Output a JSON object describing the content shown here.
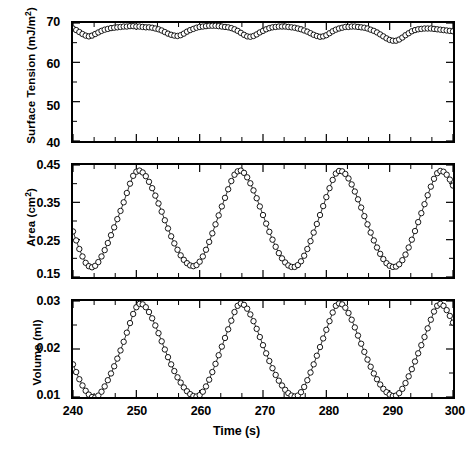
{
  "figure": {
    "panel_count": 3,
    "marker": "open-circle",
    "line_color": "#000000",
    "background": "#ffffff"
  },
  "xaxis": {
    "label": "Time (s)",
    "ticks": [
      "240",
      "250",
      "260",
      "270",
      "280",
      "290",
      "300"
    ],
    "min": 240,
    "max": 300,
    "minor_per_major": 2
  },
  "panels": [
    {
      "key": "surface_tension",
      "ylabel_main": "Surface Tension (mJ/m",
      "ylabel_sup": "2",
      "ylabel_tail": ")",
      "ylabel_plain": "Surface Tension (mJ/m2)",
      "yticks": [
        "70",
        "60",
        "50",
        "40"
      ],
      "ymin": 40,
      "ymax": 70
    },
    {
      "key": "area",
      "ylabel_main": "Area (cm",
      "ylabel_sup": "2",
      "ylabel_tail": ")",
      "ylabel_plain": "Area (cm2)",
      "yticks": [
        "0.45",
        "0.35",
        "0.25",
        "0.15"
      ],
      "ymin": 0.15,
      "ymax": 0.45
    },
    {
      "key": "volume",
      "ylabel_main": "Volume (ml)",
      "ylabel_sup": "",
      "ylabel_tail": "",
      "ylabel_plain": "Volume (ml)",
      "yticks": [
        "0.03",
        "0.02",
        "0.01"
      ],
      "ymin": 0.01,
      "ymax": 0.03
    }
  ],
  "chart_data": [
    {
      "type": "line",
      "title": "",
      "xlabel": "Time (s)",
      "ylabel": "Surface Tension (mJ/m2)",
      "xlim": [
        240,
        300
      ],
      "ylim": [
        40,
        70
      ],
      "grid": false,
      "legend": "none",
      "marker": "open-circle",
      "xticks": [
        240,
        250,
        260,
        270,
        280,
        290,
        300
      ],
      "yticks": [
        40,
        50,
        60,
        70
      ],
      "series": [
        {
          "name": "Surface Tension",
          "x": [
            240.0,
            240.5,
            241.0,
            241.5,
            242.0,
            242.5,
            243.0,
            243.5,
            244.0,
            244.5,
            245.0,
            245.5,
            246.0,
            246.5,
            247.0,
            247.5,
            248.0,
            248.5,
            249.0,
            249.5,
            250.0,
            250.5,
            251.0,
            251.5,
            252.0,
            252.5,
            253.0,
            253.5,
            254.0,
            254.5,
            255.0,
            255.5,
            256.0,
            256.5,
            257.0,
            257.5,
            258.0,
            258.5,
            259.0,
            259.5,
            260.0,
            260.5,
            261.0,
            261.5,
            262.0,
            262.5,
            263.0,
            263.5,
            264.0,
            264.5,
            265.0,
            265.5,
            266.0,
            266.5,
            267.0,
            267.5,
            268.0,
            268.5,
            269.0,
            269.5,
            270.0,
            270.5,
            271.0,
            271.5,
            272.0,
            272.5,
            273.0,
            273.5,
            274.0,
            274.5,
            275.0,
            275.5,
            276.0,
            276.5,
            277.0,
            277.5,
            278.0,
            278.5,
            279.0,
            279.5,
            280.0,
            280.5,
            281.0,
            281.5,
            282.0,
            282.5,
            283.0,
            283.5,
            284.0,
            284.5,
            285.0,
            285.5,
            286.0,
            286.5,
            287.0,
            287.5,
            288.0,
            288.5,
            289.0,
            289.5,
            290.0,
            290.5,
            291.0,
            291.5,
            292.0,
            292.5,
            293.0,
            293.5,
            294.0,
            294.5,
            295.0,
            295.5,
            296.0,
            296.5,
            297.0,
            297.5,
            298.0,
            298.5,
            299.0,
            299.5,
            300.0
          ],
          "y": [
            68.6,
            68.2,
            67.7,
            67.2,
            66.8,
            66.6,
            66.8,
            67.2,
            67.6,
            68.0,
            68.3,
            68.5,
            68.7,
            68.8,
            68.9,
            69.0,
            69.1,
            69.1,
            69.2,
            69.2,
            69.1,
            69.1,
            69.0,
            68.9,
            68.9,
            68.8,
            68.6,
            68.4,
            68.1,
            67.7,
            67.3,
            67.0,
            66.8,
            66.7,
            66.9,
            67.3,
            67.8,
            68.2,
            68.5,
            68.8,
            69.0,
            69.1,
            69.2,
            69.3,
            69.3,
            69.3,
            69.2,
            69.1,
            69.0,
            68.9,
            68.7,
            68.4,
            68.0,
            67.5,
            67.0,
            66.6,
            66.5,
            66.7,
            67.1,
            67.6,
            68.0,
            68.4,
            68.7,
            68.9,
            69.0,
            69.1,
            69.1,
            69.1,
            69.0,
            68.9,
            68.8,
            68.6,
            68.4,
            68.1,
            67.8,
            67.4,
            67.0,
            66.7,
            66.5,
            66.6,
            66.9,
            67.4,
            67.9,
            68.3,
            68.6,
            68.8,
            69.0,
            69.0,
            69.1,
            69.1,
            69.0,
            68.9,
            68.8,
            68.6,
            68.3,
            68.0,
            67.6,
            67.1,
            66.6,
            66.1,
            65.7,
            65.5,
            65.5,
            65.8,
            66.3,
            66.9,
            67.4,
            67.9,
            68.2,
            68.4,
            68.5,
            68.6,
            68.6,
            68.6,
            68.5,
            68.4,
            68.3,
            68.2,
            68.1,
            68.0,
            67.9
          ]
        }
      ]
    },
    {
      "type": "line",
      "title": "",
      "xlabel": "Time (s)",
      "ylabel": "Area (cm2)",
      "xlim": [
        240,
        300
      ],
      "ylim": [
        0.15,
        0.45
      ],
      "grid": false,
      "legend": "none",
      "marker": "open-circle",
      "xticks": [
        240,
        250,
        260,
        270,
        280,
        290,
        300
      ],
      "yticks": [
        0.15,
        0.25,
        0.35,
        0.45
      ],
      "series": [
        {
          "name": "Area",
          "x": [
            240.0,
            240.5,
            241.0,
            241.5,
            242.0,
            242.5,
            243.0,
            243.5,
            244.0,
            244.5,
            245.0,
            245.5,
            246.0,
            246.5,
            247.0,
            247.5,
            248.0,
            248.5,
            249.0,
            249.5,
            250.0,
            250.5,
            251.0,
            251.5,
            252.0,
            252.5,
            253.0,
            253.5,
            254.0,
            254.5,
            255.0,
            255.5,
            256.0,
            256.5,
            257.0,
            257.5,
            258.0,
            258.5,
            259.0,
            259.5,
            260.0,
            260.5,
            261.0,
            261.5,
            262.0,
            262.5,
            263.0,
            263.5,
            264.0,
            264.5,
            265.0,
            265.5,
            266.0,
            266.5,
            267.0,
            267.5,
            268.0,
            268.5,
            269.0,
            269.5,
            270.0,
            270.5,
            271.0,
            271.5,
            272.0,
            272.5,
            273.0,
            273.5,
            274.0,
            274.5,
            275.0,
            275.5,
            276.0,
            276.5,
            277.0,
            277.5,
            278.0,
            278.5,
            279.0,
            279.5,
            280.0,
            280.5,
            281.0,
            281.5,
            282.0,
            282.5,
            283.0,
            283.5,
            284.0,
            284.5,
            285.0,
            285.5,
            286.0,
            286.5,
            287.0,
            287.5,
            288.0,
            288.5,
            289.0,
            289.5,
            290.0,
            290.5,
            291.0,
            291.5,
            292.0,
            292.5,
            293.0,
            293.5,
            294.0,
            294.5,
            295.0,
            295.5,
            296.0,
            296.5,
            297.0,
            297.5,
            298.0,
            298.5,
            299.0,
            299.5,
            300.0
          ],
          "y": [
            0.272,
            0.248,
            0.225,
            0.205,
            0.188,
            0.179,
            0.176,
            0.18,
            0.19,
            0.205,
            0.222,
            0.241,
            0.262,
            0.283,
            0.305,
            0.327,
            0.35,
            0.375,
            0.4,
            0.421,
            0.432,
            0.435,
            0.43,
            0.42,
            0.405,
            0.388,
            0.368,
            0.347,
            0.325,
            0.302,
            0.28,
            0.259,
            0.24,
            0.223,
            0.208,
            0.196,
            0.187,
            0.181,
            0.179,
            0.182,
            0.191,
            0.205,
            0.223,
            0.244,
            0.267,
            0.291,
            0.315,
            0.339,
            0.362,
            0.385,
            0.407,
            0.424,
            0.433,
            0.435,
            0.429,
            0.417,
            0.401,
            0.382,
            0.361,
            0.339,
            0.316,
            0.293,
            0.271,
            0.25,
            0.231,
            0.214,
            0.2,
            0.189,
            0.181,
            0.177,
            0.177,
            0.182,
            0.192,
            0.207,
            0.225,
            0.246,
            0.269,
            0.292,
            0.316,
            0.34,
            0.364,
            0.388,
            0.41,
            0.427,
            0.434,
            0.433,
            0.426,
            0.414,
            0.398,
            0.379,
            0.358,
            0.336,
            0.313,
            0.291,
            0.269,
            0.248,
            0.229,
            0.212,
            0.198,
            0.187,
            0.18,
            0.177,
            0.178,
            0.184,
            0.195,
            0.21,
            0.229,
            0.25,
            0.273,
            0.297,
            0.321,
            0.345,
            0.369,
            0.392,
            0.413,
            0.428,
            0.434,
            0.432,
            0.424,
            0.411,
            0.395
          ]
        }
      ]
    },
    {
      "type": "line",
      "title": "",
      "xlabel": "Time (s)",
      "ylabel": "Volume (ml)",
      "xlim": [
        240,
        300
      ],
      "ylim": [
        0.01,
        0.03
      ],
      "grid": false,
      "legend": "none",
      "marker": "open-circle",
      "xticks": [
        240,
        250,
        260,
        270,
        280,
        290,
        300
      ],
      "yticks": [
        0.01,
        0.02,
        0.03
      ],
      "series": [
        {
          "name": "Volume",
          "x": [
            240.0,
            240.5,
            241.0,
            241.5,
            242.0,
            242.5,
            243.0,
            243.5,
            244.0,
            244.5,
            245.0,
            245.5,
            246.0,
            246.5,
            247.0,
            247.5,
            248.0,
            248.5,
            249.0,
            249.5,
            250.0,
            250.5,
            251.0,
            251.5,
            252.0,
            252.5,
            253.0,
            253.5,
            254.0,
            254.5,
            255.0,
            255.5,
            256.0,
            256.5,
            257.0,
            257.5,
            258.0,
            258.5,
            259.0,
            259.5,
            260.0,
            260.5,
            261.0,
            261.5,
            262.0,
            262.5,
            263.0,
            263.5,
            264.0,
            264.5,
            265.0,
            265.5,
            266.0,
            266.5,
            267.0,
            267.5,
            268.0,
            268.5,
            269.0,
            269.5,
            270.0,
            270.5,
            271.0,
            271.5,
            272.0,
            272.5,
            273.0,
            273.5,
            274.0,
            274.5,
            275.0,
            275.5,
            276.0,
            276.5,
            277.0,
            277.5,
            278.0,
            278.5,
            279.0,
            279.5,
            280.0,
            280.5,
            281.0,
            281.5,
            282.0,
            282.5,
            283.0,
            283.5,
            284.0,
            284.5,
            285.0,
            285.5,
            286.0,
            286.5,
            287.0,
            287.5,
            288.0,
            288.5,
            289.0,
            289.5,
            290.0,
            290.5,
            291.0,
            291.5,
            292.0,
            292.5,
            293.0,
            293.5,
            294.0,
            294.5,
            295.0,
            295.5,
            296.0,
            296.5,
            297.0,
            297.5,
            298.0,
            298.5,
            299.0,
            299.5,
            300.0
          ],
          "y": [
            0.0168,
            0.0152,
            0.0137,
            0.0124,
            0.0113,
            0.0105,
            0.01,
            0.0099,
            0.0103,
            0.0111,
            0.0122,
            0.0135,
            0.0149,
            0.0164,
            0.018,
            0.0197,
            0.0215,
            0.0234,
            0.0254,
            0.0273,
            0.0287,
            0.0294,
            0.0293,
            0.0287,
            0.0277,
            0.0264,
            0.0249,
            0.0233,
            0.0216,
            0.0199,
            0.0183,
            0.0168,
            0.0154,
            0.0141,
            0.013,
            0.012,
            0.0112,
            0.0106,
            0.0102,
            0.0101,
            0.0104,
            0.0111,
            0.0122,
            0.0136,
            0.0152,
            0.0169,
            0.0187,
            0.0205,
            0.0223,
            0.0241,
            0.0259,
            0.0277,
            0.029,
            0.0295,
            0.0292,
            0.0284,
            0.0272,
            0.0258,
            0.0242,
            0.0225,
            0.0208,
            0.0191,
            0.0175,
            0.016,
            0.0146,
            0.0134,
            0.0124,
            0.0115,
            0.0108,
            0.0103,
            0.0101,
            0.0103,
            0.011,
            0.0121,
            0.0135,
            0.0151,
            0.0168,
            0.0186,
            0.0204,
            0.0222,
            0.024,
            0.0258,
            0.0276,
            0.029,
            0.0295,
            0.0293,
            0.0286,
            0.0275,
            0.0261,
            0.0245,
            0.0228,
            0.0211,
            0.0194,
            0.0178,
            0.0163,
            0.0149,
            0.0137,
            0.0126,
            0.0117,
            0.011,
            0.0105,
            0.0102,
            0.0103,
            0.0108,
            0.0117,
            0.0129,
            0.0143,
            0.0158,
            0.0174,
            0.0191,
            0.0208,
            0.0225,
            0.0243,
            0.0261,
            0.0278,
            0.029,
            0.0294,
            0.029,
            0.0281,
            0.0269,
            0.0255
          ]
        }
      ]
    }
  ]
}
